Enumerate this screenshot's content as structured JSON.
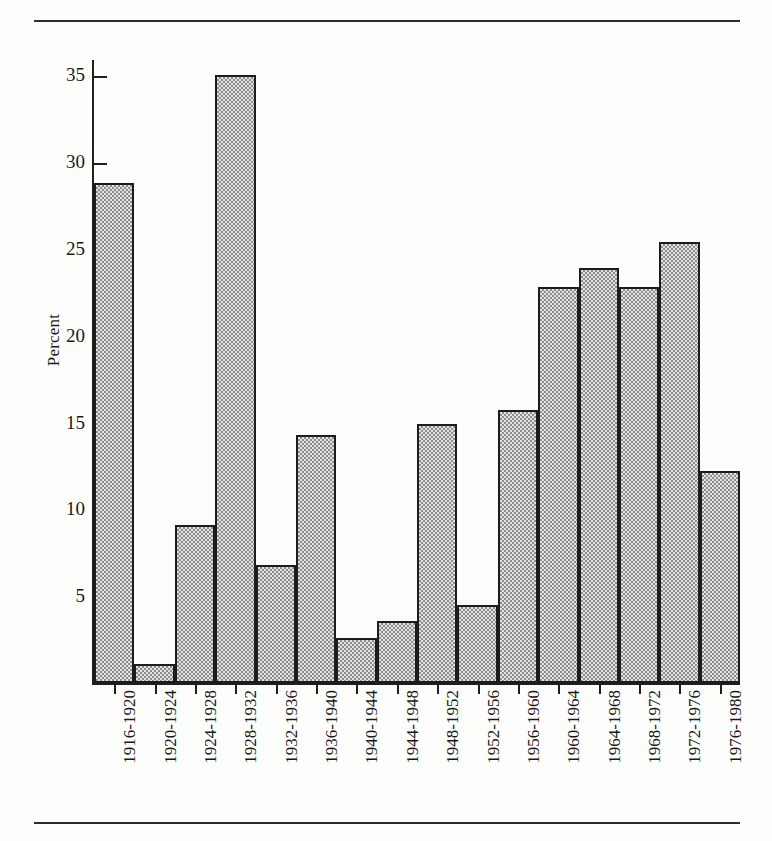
{
  "figure": {
    "rules": {
      "top": "horizontal-rule",
      "bottom": "horizontal-rule"
    }
  },
  "chart_data": {
    "type": "bar",
    "title": "",
    "xlabel": "",
    "ylabel": "Percent",
    "ylim": [
      0,
      36
    ],
    "yticks": [
      5,
      10,
      15,
      20,
      25,
      30,
      35
    ],
    "ytick_labels": [
      "5",
      "10",
      "15",
      "20",
      "25",
      "30",
      "35"
    ],
    "grid": false,
    "legend": null,
    "categories": [
      "1916-1920",
      "1920-1924",
      "1924-1928",
      "1928-1932",
      "1932-1936",
      "1936-1940",
      "1940-1944",
      "1944-1948",
      "1948-1952",
      "1952-1956",
      "1956-1960",
      "1960-1964",
      "1964-1968",
      "1968-1972",
      "1972-1976",
      "1976-1980"
    ],
    "values": [
      28.8,
      1.1,
      9.1,
      35.0,
      6.8,
      14.3,
      2.6,
      3.6,
      14.9,
      4.5,
      15.7,
      22.8,
      23.9,
      22.8,
      25.4,
      12.2
    ],
    "bar_style": {
      "fill": "#b9b9b9",
      "pattern": "checkered-stipple",
      "edge": "#1c1c1c"
    }
  }
}
